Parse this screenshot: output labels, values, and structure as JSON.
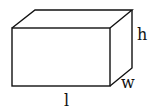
{
  "diagram": {
    "type": "rectangular-prism",
    "stroke_color": "#111111",
    "background": "#ffffff",
    "labels": {
      "length": "l",
      "width": "w",
      "height": "h"
    },
    "vertices": {
      "front_top_left": [
        12,
        28
      ],
      "front_top_right": [
        110,
        28
      ],
      "front_bottom_left": [
        12,
        86
      ],
      "front_bottom_right": [
        110,
        86
      ],
      "back_top_left": [
        35,
        10
      ],
      "back_top_right": [
        132,
        10
      ],
      "back_bottom_right": [
        132,
        68
      ]
    }
  }
}
